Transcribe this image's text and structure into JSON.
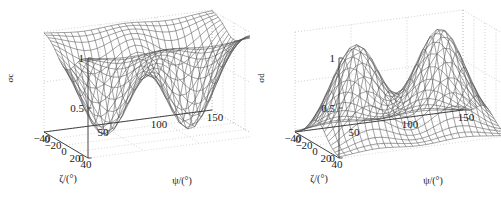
{
  "figure": {
    "background_color": "#ffffff",
    "mesh_color": "#555555",
    "grid_color": "#bbbbbb",
    "axis_color": "#333333",
    "panel_count": 2
  },
  "chart_data": [
    {
      "type": "surface",
      "id": "sigma-c",
      "title": "",
      "zlabel": "σc",
      "xlabel": "ζ/(°)",
      "ylabel": "ψ/(°)",
      "xlim": [
        -40,
        40
      ],
      "ylim": [
        0,
        150
      ],
      "zlim": [
        0,
        1
      ],
      "xticks": [
        40,
        20,
        0,
        -20,
        -40
      ],
      "yticks": [
        0,
        50,
        100,
        150
      ],
      "zticks": [
        0,
        0.5,
        1
      ],
      "xticklabels": [
        "40",
        "20",
        "0",
        "−20",
        "−40"
      ],
      "yticklabels": [
        "0",
        "50",
        "100",
        "150"
      ],
      "zticklabels": [
        "0",
        "0.5",
        "1"
      ],
      "grid": true,
      "legend": "none",
      "description": "Mesh surface with two deep valleys dropping from a plateau of 1 down to 0; complement of the two-peak surface.",
      "formula": "1 - exp(-((psi-35)^2/900 + zeta^2/500)) - exp(-((psi-110)^2/900 + zeta^2/500))",
      "peak_centers": [
        {
          "psi": 35,
          "zeta": 0,
          "z": 0.0
        },
        {
          "psi": 110,
          "zeta": 0,
          "z": 0.0
        }
      ],
      "plateau_value": 1.0,
      "nx": 21,
      "ny": 25
    },
    {
      "type": "surface",
      "id": "sigma-d",
      "title": "",
      "zlabel": "σd",
      "xlabel": "ζ/(°)",
      "ylabel": "ψ/(°)",
      "xlim": [
        -40,
        40
      ],
      "ylim": [
        0,
        150
      ],
      "zlim": [
        0,
        1
      ],
      "xticks": [
        40,
        20,
        0,
        -20,
        -40
      ],
      "yticks": [
        0,
        50,
        100,
        150
      ],
      "zticks": [
        0,
        0.5,
        1
      ],
      "xticklabels": [
        "40",
        "20",
        "0",
        "−20",
        "−40"
      ],
      "yticklabels": [
        "0",
        "50",
        "100",
        "150"
      ],
      "zticklabels": [
        "0",
        "0.5",
        "1"
      ],
      "grid": true,
      "legend": "none",
      "description": "Mesh surface with two Gaussian peaks rising from a flat floor of 0 to about 1.",
      "formula": "exp(-((psi-35)^2/900 + zeta^2/500)) + exp(-((psi-110)^2/900 + zeta^2/500))",
      "peak_centers": [
        {
          "psi": 35,
          "zeta": 0,
          "z": 0.95
        },
        {
          "psi": 110,
          "zeta": 0,
          "z": 1.0
        }
      ],
      "floor_value": 0.0,
      "nx": 21,
      "ny": 25
    }
  ],
  "panels": [
    {
      "name": "left-plot",
      "zlabel": "σc",
      "xlabel": "ζ/(°)",
      "ylabel": "ψ/(°)",
      "zticklabels": [
        "1",
        "0.5",
        "0"
      ],
      "xticklabels": [
        "40",
        "20",
        "0",
        "−20",
        "−40"
      ],
      "yticklabels": [
        "0",
        "50",
        "100",
        "150"
      ]
    },
    {
      "name": "right-plot",
      "zlabel": "σd",
      "xlabel": "ζ/(°)",
      "ylabel": "ψ/(°)",
      "zticklabels": [
        "1",
        "0.5",
        "0"
      ],
      "xticklabels": [
        "40",
        "20",
        "0",
        "−20",
        "−40"
      ],
      "yticklabels": [
        "0",
        "50",
        "100",
        "150"
      ]
    }
  ]
}
